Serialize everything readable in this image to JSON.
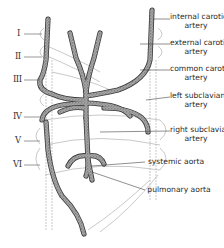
{
  "diagram": {
    "arch_numerals": [
      "I",
      "II",
      "III",
      "IV",
      "V",
      "VI"
    ],
    "labels": {
      "internal_carotid": [
        "internal carotid",
        "artery"
      ],
      "external_carotid": [
        "external carotid",
        "artery"
      ],
      "common_carotid": [
        "common carotid",
        "artery"
      ],
      "left_subclavian": [
        "left subclavian",
        "artery"
      ],
      "right_subclavian": [
        "right subclavian",
        "artery"
      ],
      "systemic_aorta": [
        "systemic aorta"
      ],
      "pulmonary_aorta": [
        "pulmonary aorta"
      ]
    },
    "colors": {
      "vessel_fill": "#8a8a8a",
      "vessel_outline": "#3a3a3a",
      "embryonic_outline": "#9a9a9a",
      "text": "#2a2a2a",
      "background": "#ffffff"
    }
  }
}
